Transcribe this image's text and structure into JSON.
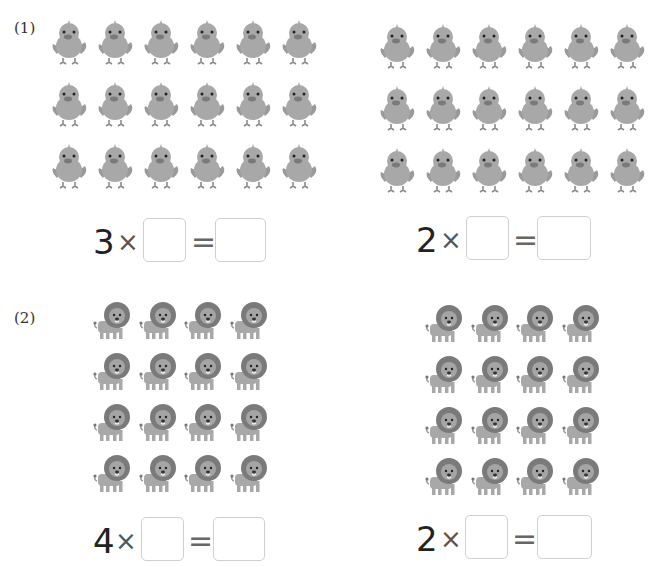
{
  "problems": [
    {
      "label": "(1)",
      "animal": "chick",
      "groups": [
        {
          "rows": 3,
          "cols": 6,
          "count": 18,
          "equation": {
            "multiplicand": "3",
            "operator": "×",
            "equals": "=",
            "blank_multiplier": "",
            "blank_product": ""
          }
        },
        {
          "rows": 3,
          "cols": 6,
          "count": 18,
          "equation": {
            "multiplicand": "2",
            "operator": "×",
            "equals": "=",
            "blank_multiplier": "",
            "blank_product": ""
          }
        }
      ]
    },
    {
      "label": "(2)",
      "animal": "lion",
      "groups": [
        {
          "rows": 4,
          "cols": 4,
          "count": 16,
          "equation": {
            "multiplicand": "4",
            "operator": "×",
            "equals": "=",
            "blank_multiplier": "",
            "blank_product": ""
          }
        },
        {
          "rows": 4,
          "cols": 4,
          "count": 16,
          "equation": {
            "multiplicand": "2",
            "operator": "×",
            "equals": "=",
            "blank_multiplier": "",
            "blank_product": ""
          }
        }
      ]
    }
  ],
  "colors": {
    "animal_body": "#a8a8a8",
    "animal_dark": "#7a7a7a",
    "box_border": "#cfcfcf",
    "text": "#222222"
  }
}
